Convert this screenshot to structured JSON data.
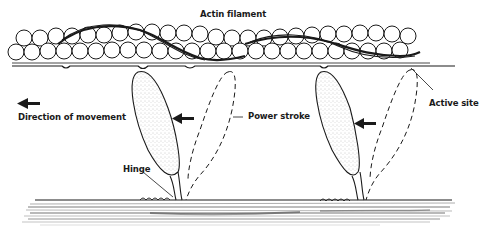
{
  "labels": {
    "actin_filament": "Actin filament",
    "direction_of_movement": "Direction of movement",
    "power_stroke": "Power stroke",
    "active_site": "Active site",
    "hinge": "Hinge"
  },
  "colors": {
    "ink": "#1a1a1a",
    "stipple": "#9a9a9a",
    "background": "#ffffff"
  },
  "elements": {
    "actin_beads": "double row of globular actin monomers",
    "tropomyosin": "dark strand winding around actin",
    "myosin_heads": 2,
    "myosin_head_states": [
      "solid stippled (post-stroke)",
      "dashed outline (pre-stroke)"
    ],
    "arrows": 3
  }
}
